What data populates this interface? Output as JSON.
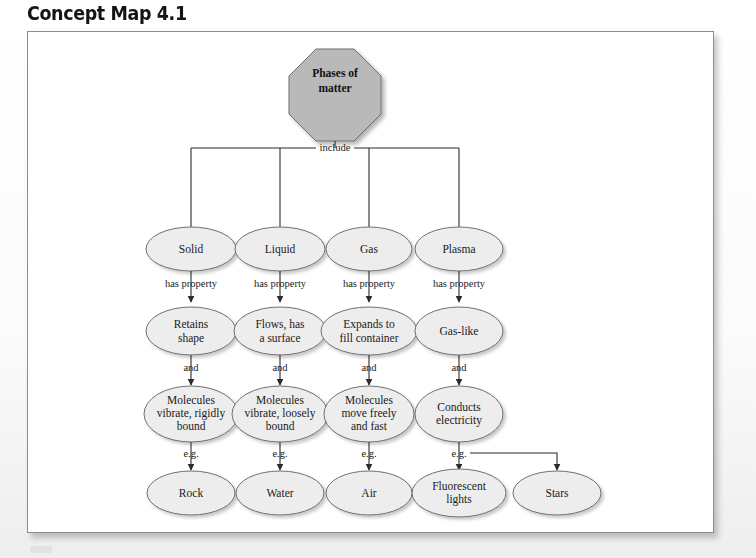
{
  "page": {
    "title": "Concept Map 4.1",
    "frame_border_color": "#8d8d8d",
    "background_color": "#f2f2f2"
  },
  "diagram": {
    "type": "concept-map",
    "root": {
      "id": "phases-of-matter",
      "shape": "octagon",
      "lines": [
        "Phases of",
        "matter"
      ],
      "fill": "#b9b9b9",
      "cx": 307,
      "cy": 47
    },
    "root_link_label": "include",
    "columns": [
      {
        "key": "solid",
        "cx": 163,
        "nodes": [
          {
            "row": 1,
            "lines": [
              "Solid"
            ]
          },
          {
            "row": 2,
            "lines": [
              "Retains",
              "shape"
            ]
          },
          {
            "row": 3,
            "lines": [
              "Molecules",
              "vibrate, rigidly",
              "bound"
            ]
          },
          {
            "row": 4,
            "lines": [
              "Rock"
            ]
          }
        ],
        "link_labels": [
          "has property",
          "and",
          "e.g."
        ]
      },
      {
        "key": "liquid",
        "cx": 252,
        "nodes": [
          {
            "row": 1,
            "lines": [
              "Liquid"
            ]
          },
          {
            "row": 2,
            "lines": [
              "Flows, has",
              "a surface"
            ]
          },
          {
            "row": 3,
            "lines": [
              "Molecules",
              "vibrate, loosely",
              "bound"
            ]
          },
          {
            "row": 4,
            "lines": [
              "Water"
            ]
          }
        ],
        "link_labels": [
          "has property",
          "and",
          "e.g."
        ]
      },
      {
        "key": "gas",
        "cx": 341,
        "nodes": [
          {
            "row": 1,
            "lines": [
              "Gas"
            ]
          },
          {
            "row": 2,
            "lines": [
              "Expands to",
              "fill container"
            ]
          },
          {
            "row": 3,
            "lines": [
              "Molecules",
              "move freely",
              "and fast"
            ]
          },
          {
            "row": 4,
            "lines": [
              "Air"
            ]
          }
        ],
        "link_labels": [
          "has property",
          "and",
          "e.g."
        ]
      },
      {
        "key": "plasma",
        "cx": 431,
        "nodes": [
          {
            "row": 1,
            "lines": [
              "Plasma"
            ]
          },
          {
            "row": 2,
            "lines": [
              "Gas-like"
            ]
          },
          {
            "row": 3,
            "lines": [
              "Conducts",
              "electricity"
            ]
          },
          {
            "row": 4,
            "lines": [
              "Fluorescent",
              "lights"
            ]
          }
        ],
        "link_labels": [
          "has property",
          "and",
          "e.g."
        ]
      }
    ],
    "extra_node": {
      "key": "stars",
      "cx": 529,
      "row": 4,
      "lines": [
        "Stars"
      ],
      "from": "plasma",
      "link_label": "e.g."
    },
    "row_y": [
      217,
      299,
      382,
      461
    ],
    "ellipse_fill": "#ededed",
    "ellipse_stroke": "#6f6f6f",
    "connector_color": "#2b2b2b"
  }
}
